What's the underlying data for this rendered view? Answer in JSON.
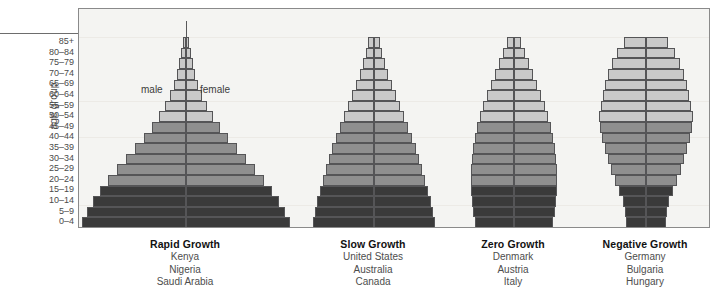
{
  "axis": {
    "y_title": "age group",
    "age_groups": [
      "85+",
      "80–84",
      "75–79",
      "70–74",
      "65–69",
      "60–64",
      "55–59",
      "50–54",
      "45–49",
      "40–44",
      "35–39",
      "30–34",
      "25–29",
      "20–24",
      "15–19",
      "10–14",
      "5–9",
      "0–4"
    ]
  },
  "legend": {
    "male": "male",
    "female": "female"
  },
  "colors": {
    "plot_background": "#f4f4f2",
    "frame": "#8a8a8a",
    "axis_line": "#58585a",
    "bar_border": "#555557",
    "band_light": "#c9c9c9",
    "band_mid": "#8f8f8f",
    "band_dark": "#3a3a3a",
    "tick_text": "#4a4a4a",
    "title_text": "#111111"
  },
  "captions": [
    {
      "title": "Rapid Growth",
      "countries": [
        "Kenya",
        "Nigeria",
        "Saudi Arabia"
      ]
    },
    {
      "title": "Slow Growth",
      "countries": [
        "United States",
        "Australia",
        "Canada"
      ]
    },
    {
      "title": "Zero Growth",
      "countries": [
        "Denmark",
        "Austria",
        "Italy"
      ]
    },
    {
      "title": "Negative Growth",
      "countries": [
        "Germany",
        "Bulgaria",
        "Hungary"
      ]
    }
  ],
  "chart_data": {
    "type": "bar",
    "subtype": "population-pyramid",
    "xlabel": "",
    "ylabel": "age group",
    "grid": false,
    "legend_position": "inside-top-left",
    "categories": [
      "85+",
      "80–84",
      "75–79",
      "70–74",
      "65–69",
      "60–64",
      "55–59",
      "50–54",
      "45–49",
      "40–44",
      "35–39",
      "30–34",
      "25–29",
      "20–24",
      "15–19",
      "10–14",
      "5–9",
      "0–4"
    ],
    "note": "Widths are per-side (male = left of centre axis, female = right), expressed in pixels of half-bar width as read off the plot.",
    "panels": [
      {
        "name": "Rapid Growth",
        "countries": [
          "Kenya",
          "Nigeria",
          "Saudi Arabia"
        ],
        "center_x": 185,
        "half_widths": [
          3,
          5,
          7,
          9,
          12,
          16,
          21,
          27,
          34,
          42,
          51,
          60,
          69,
          78,
          86,
          93,
          99,
          104
        ],
        "shades": [
          "light",
          "light",
          "light",
          "light",
          "light",
          "light",
          "light",
          "light",
          "mid",
          "mid",
          "mid",
          "mid",
          "mid",
          "mid",
          "dark",
          "dark",
          "dark",
          "dark"
        ]
      },
      {
        "name": "Slow Growth",
        "countries": [
          "United States",
          "Australia",
          "Canada"
        ],
        "center_x": 373,
        "half_widths": [
          6,
          8,
          11,
          14,
          18,
          22,
          26,
          30,
          34,
          38,
          42,
          45,
          48,
          51,
          54,
          57,
          59,
          61
        ],
        "shades": [
          "light",
          "light",
          "light",
          "light",
          "light",
          "light",
          "light",
          "light",
          "mid",
          "mid",
          "mid",
          "mid",
          "mid",
          "mid",
          "dark",
          "dark",
          "dark",
          "dark"
        ]
      },
      {
        "name": "Zero Growth",
        "countries": [
          "Denmark",
          "Austria",
          "Italy"
        ],
        "center_x": 513,
        "half_widths": [
          7,
          11,
          15,
          19,
          23,
          27,
          31,
          34,
          37,
          39,
          41,
          42,
          43,
          43,
          43,
          42,
          41,
          39
        ],
        "shades": [
          "light",
          "light",
          "light",
          "light",
          "light",
          "light",
          "light",
          "light",
          "mid",
          "mid",
          "mid",
          "mid",
          "mid",
          "mid",
          "dark",
          "dark",
          "dark",
          "dark"
        ]
      },
      {
        "name": "Negative Growth",
        "countries": [
          "Germany",
          "Bulgaria",
          "Hungary"
        ],
        "center_x": 645,
        "half_widths": [
          22,
          29,
          34,
          38,
          41,
          43,
          45,
          47,
          46,
          44,
          41,
          38,
          35,
          31,
          27,
          23,
          21,
          20
        ],
        "shades": [
          "light",
          "light",
          "light",
          "light",
          "light",
          "light",
          "light",
          "light",
          "mid",
          "mid",
          "mid",
          "mid",
          "mid",
          "mid",
          "dark",
          "dark",
          "dark",
          "dark"
        ]
      }
    ],
    "spires": [
      {
        "panel": "Rapid Growth",
        "top_y": 12,
        "bottom_y": 60
      },
      {
        "panel": "Slow Growth",
        "top_y": 28,
        "bottom_y": 55
      },
      {
        "panel": "Zero Growth",
        "top_y": 28,
        "bottom_y": 52
      },
      {
        "panel": "Negative Growth",
        "top_y": 28,
        "bottom_y": 48
      }
    ]
  }
}
